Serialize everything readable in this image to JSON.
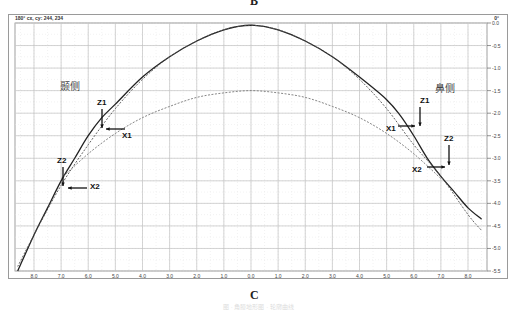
{
  "figure": {
    "top_letter": "B",
    "caption_letter": "C",
    "title_left": "180°  cx, cy: 244, 234",
    "title_right": "0°",
    "side_label_left": "颞侧",
    "side_label_right": "鼻侧",
    "footer_text": "图 · 角膜地形图 · 轮廓曲线"
  },
  "annotations": {
    "left": [
      {
        "label": "Z1",
        "type": "down-arrow"
      },
      {
        "label": "X1",
        "type": "left-arrow"
      },
      {
        "label": "Z2",
        "type": "down-arrow"
      },
      {
        "label": "X2",
        "type": "left-arrow"
      }
    ],
    "right": [
      {
        "label": "Z1",
        "type": "down-arrow"
      },
      {
        "label": "X1",
        "type": "right-arrow"
      },
      {
        "label": "Z2",
        "type": "down-arrow"
      },
      {
        "label": "X2",
        "type": "right-arrow"
      }
    ]
  },
  "chart_data": {
    "type": "line",
    "title": "180° cx, cy: 244, 234",
    "xlabel": "",
    "ylabel": "",
    "x_tick_labels": [
      "8.0",
      "7.0",
      "6.0",
      "5.0",
      "4.0",
      "3.0",
      "2.0",
      "1.0",
      "0.0",
      "1.0",
      "2.0",
      "3.0",
      "4.0",
      "5.0",
      "6.0",
      "7.0",
      "8.0"
    ],
    "y_tick_labels": [
      "0.0",
      "-0.5",
      "-1.0",
      "-1.5",
      "-2.0",
      "-2.5",
      "-3.0",
      "-3.5",
      "-4.0",
      "-4.5",
      "-5.0",
      "-5.5"
    ],
    "xlim": [
      -8.7,
      8.7
    ],
    "ylim": [
      -5.5,
      0.0
    ],
    "grid": true,
    "series": [
      {
        "name": "measured profile (solid)",
        "style": "solid",
        "color": "#222222",
        "x": [
          -8.6,
          -8.0,
          -7.5,
          -7.0,
          -6.5,
          -6.0,
          -5.5,
          -5.0,
          -4.0,
          -3.0,
          -2.0,
          -1.0,
          0.0,
          1.0,
          2.0,
          3.0,
          4.0,
          5.0,
          5.5,
          6.0,
          6.5,
          7.0,
          7.5,
          8.0,
          8.5
        ],
        "y": [
          -5.5,
          -4.7,
          -4.1,
          -3.5,
          -3.0,
          -2.5,
          -2.1,
          -1.8,
          -1.2,
          -0.75,
          -0.4,
          -0.15,
          -0.05,
          -0.15,
          -0.4,
          -0.75,
          -1.2,
          -1.7,
          -2.05,
          -2.5,
          -3.0,
          -3.4,
          -3.75,
          -4.1,
          -4.35
        ]
      },
      {
        "name": "best-fit sphere (dashed, upper)",
        "style": "dashed",
        "color": "#555555",
        "x": [
          -8.6,
          -8.0,
          -7.0,
          -6.0,
          -5.0,
          -4.0,
          -3.0,
          -2.0,
          -1.0,
          0.0,
          1.0,
          2.0,
          3.0,
          4.0,
          5.0,
          6.0,
          7.0,
          8.0,
          8.5
        ],
        "y": [
          -5.4,
          -4.7,
          -3.6,
          -2.7,
          -1.9,
          -1.25,
          -0.75,
          -0.4,
          -0.15,
          -0.05,
          -0.15,
          -0.4,
          -0.75,
          -1.25,
          -1.9,
          -2.7,
          -3.4,
          -4.25,
          -4.6
        ]
      },
      {
        "name": "reference curve (dashed, lower)",
        "style": "dashed",
        "color": "#777777",
        "x": [
          -7.0,
          -6.0,
          -5.0,
          -4.0,
          -3.0,
          -2.0,
          -1.0,
          0.0,
          1.0,
          2.0,
          3.0,
          4.0,
          5.0,
          6.0,
          7.0
        ],
        "y": [
          -3.45,
          -2.9,
          -2.45,
          -2.1,
          -1.85,
          -1.65,
          -1.55,
          -1.5,
          -1.55,
          -1.65,
          -1.85,
          -2.1,
          -2.45,
          -2.9,
          -3.45
        ]
      }
    ],
    "annotations": [
      "颞侧",
      "鼻侧",
      "Z1",
      "X1",
      "Z2",
      "X2"
    ]
  }
}
